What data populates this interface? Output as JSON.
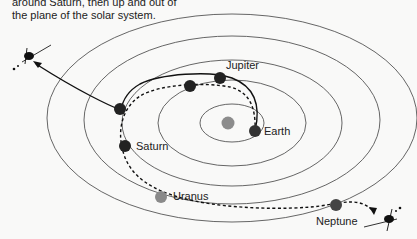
{
  "caption": {
    "lines": [
      "around Saturn, then up and out of",
      "the plane of the solar system."
    ]
  },
  "planets": [
    {
      "name": "Earth",
      "label": "Earth",
      "color": "#333333"
    },
    {
      "name": "Jupiter",
      "label": "Jupiter",
      "color": "#222222"
    },
    {
      "name": "Saturn",
      "label": "Saturn",
      "color": "#222222"
    },
    {
      "name": "Uranus",
      "label": "Uranus",
      "color": "#8a8a8a"
    },
    {
      "name": "Neptune",
      "label": "Neptune",
      "color": "#444444"
    }
  ],
  "sun": {
    "color": "#8c8c8c"
  },
  "trajectories": [
    {
      "name": "solid-path",
      "style": "solid",
      "description": "Earth to Jupiter to Saturn, then up and out of the solar plane"
    },
    {
      "name": "dashed-path",
      "style": "dashed",
      "description": "Earth to Jupiter, Saturn, Uranus, Neptune"
    }
  ],
  "colors": {
    "orbit": "#555555",
    "path": "#111111",
    "background": "#f9f9f8"
  }
}
